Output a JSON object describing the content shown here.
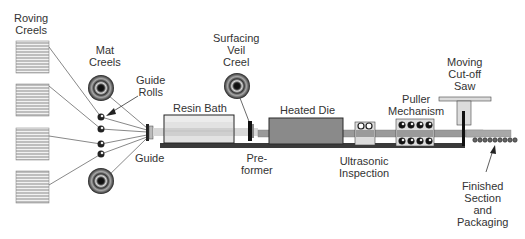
{
  "diagram": {
    "labels": {
      "roving_creels": [
        "Roving",
        "Creels"
      ],
      "mat_creels": [
        "Mat",
        "Creels"
      ],
      "guide_rolls": [
        "Guide",
        "Rolls"
      ],
      "guide": [
        "Guide"
      ],
      "resin_bath": [
        "Resin Bath"
      ],
      "surfacing_veil_creel": [
        "Surfacing",
        "Veil",
        "Creel"
      ],
      "preformer": [
        "Pre-",
        "former"
      ],
      "heated_die": [
        "Heated Die"
      ],
      "ultrasonic_inspection": [
        "Ultrasonic",
        "Inspection"
      ],
      "puller_mechanism": [
        "Puller",
        "Mechanism"
      ],
      "moving_cutoff_saw": [
        "Moving",
        "Cut-off",
        "Saw"
      ],
      "finished_section": [
        "Finished",
        "Section",
        "and",
        "Packaging"
      ]
    },
    "colors": {
      "outline": "#2a2a2a",
      "base_rail": "#3a3a3a",
      "die_fill": "#8a8a8a",
      "profile_fill": "#9a9a9a",
      "light_fill": "#dcdcdc",
      "bath_fill": "#e6e6e6"
    },
    "components": {
      "roving_creel_count": 4,
      "mat_creel_count": 2,
      "guide_roll_count": 4,
      "puller_roller_count_per_row": 4,
      "ultrasonic_roller_count": 2,
      "finished_section_count": 9
    }
  }
}
